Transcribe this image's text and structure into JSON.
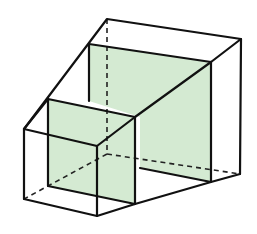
{
  "diagram": {
    "title": "",
    "colors": {
      "panel_fill": "#d4ead2",
      "edge": "#111111",
      "background": "#ffffff"
    },
    "elements": [
      {
        "name": "outer-solid",
        "type": "solid outline"
      },
      {
        "name": "large-cross-section",
        "type": "shaded panel"
      },
      {
        "name": "small-cross-section",
        "type": "shaded panel"
      },
      {
        "name": "hidden-edges",
        "type": "dashed lines"
      }
    ]
  }
}
